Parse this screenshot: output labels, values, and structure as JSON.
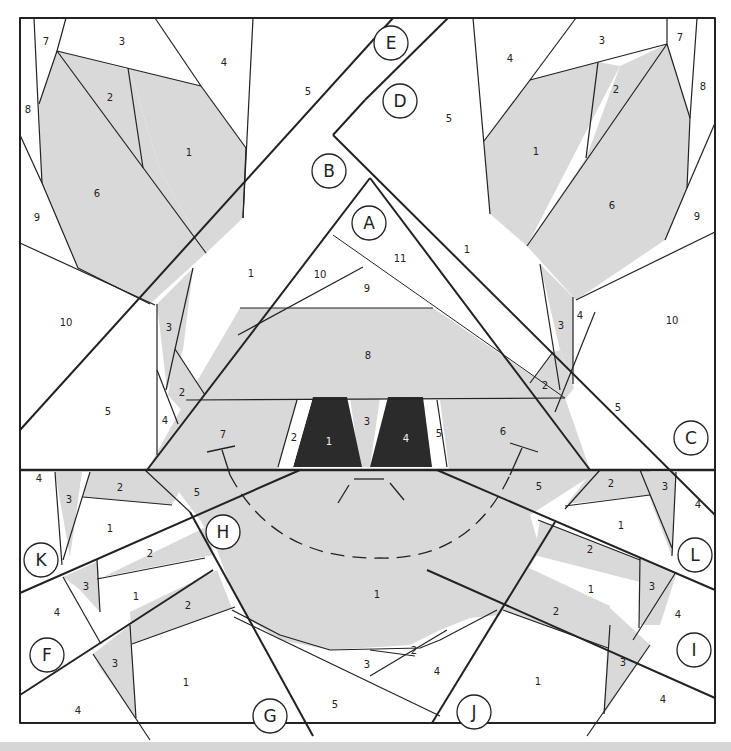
{
  "colors": {
    "gray": "#d9d9d9",
    "dark": "#2b2b2b",
    "white": "#ffffff",
    "line": "#222222",
    "footer": "#d6d6d6"
  },
  "sections": [
    "A",
    "B",
    "C",
    "D",
    "E",
    "F",
    "G",
    "H",
    "I",
    "J",
    "K",
    "L"
  ],
  "labels": {
    "TL_7": "7",
    "TL_3": "3",
    "TL_4": "4",
    "TL_8": "8",
    "TL_2": "2",
    "TL_1": "1",
    "TL_5": "5",
    "TL_6": "6",
    "TL_9": "9",
    "TL_10": "10",
    "TR_7": "7",
    "TR_3": "3",
    "TR_4": "4",
    "TR_8": "8",
    "TR_2": "2",
    "TR_1": "1",
    "TR_5": "5",
    "TR_6": "6",
    "TR_9": "9",
    "TR_10": "10",
    "A_11": "11",
    "A_10": "10",
    "A_9": "9",
    "A_8": "8",
    "A_7": "7",
    "A_2": "2",
    "A_1": "1",
    "A_3": "3",
    "A_4": "4",
    "A_5": "5",
    "A_6": "6",
    "B_1": "1",
    "D_1": "1",
    "ML_3": "3",
    "ML_2": "2",
    "ML_4": "4",
    "ML_5": "5",
    "MR_3": "3",
    "MR_4": "4",
    "MR_2": "2",
    "MR_5": "5",
    "K_4": "4",
    "K_3": "3",
    "K_2": "2",
    "K_1": "1",
    "H_5": "5",
    "H_2": "2",
    "F_3": "3",
    "F_4": "4",
    "F_1": "1",
    "F_2": "2",
    "G_3": "3",
    "G_1": "1",
    "G_4": "4",
    "body_1": "1",
    "bottom_2": "2",
    "bottom_3": "3",
    "bottom_4": "4",
    "bottom_5": "5",
    "L_2": "2",
    "L_3": "3",
    "L_4": "4",
    "L_1": "1",
    "R5": "5",
    "L2b": "2",
    "I_3": "3",
    "I_1": "1",
    "I_4": "4",
    "I_2": "2",
    "J_1": "1",
    "J_3": "3",
    "J_4": "4"
  }
}
